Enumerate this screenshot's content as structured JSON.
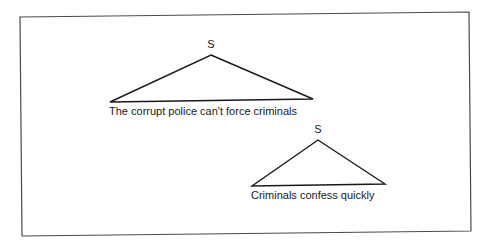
{
  "diagram": {
    "type": "syntax-tree-fragments",
    "trees": [
      {
        "node_label": "S",
        "leaf_text": "The corrupt police can't force criminals"
      },
      {
        "node_label": "S",
        "leaf_text": "Criminals confess quickly"
      }
    ]
  },
  "colors": {
    "background": "#ffffff",
    "frame": "#4a4a4a",
    "ink": "#1a1a1a"
  }
}
